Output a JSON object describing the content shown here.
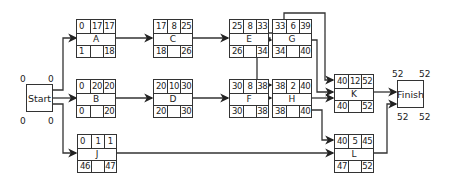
{
  "diagram": {
    "type": "activity-on-node network (PERT/CPM)",
    "start": {
      "label": "Start",
      "tl": "0",
      "tr": "0",
      "bl": "0",
      "br": "0"
    },
    "finish": {
      "label": "Finish",
      "tl": "52",
      "tr": "52",
      "bl": "52",
      "br": "52"
    },
    "nodes": {
      "A": {
        "name": "A",
        "es": "0",
        "dur": "17",
        "ef": "17",
        "ls": "1",
        "lf": "18"
      },
      "B": {
        "name": "B",
        "es": "0",
        "dur": "20",
        "ef": "20",
        "ls": "0",
        "lf": "20"
      },
      "C": {
        "name": "C",
        "es": "17",
        "dur": "8",
        "ef": "25",
        "ls": "18",
        "lf": "26"
      },
      "D": {
        "name": "D",
        "es": "20",
        "dur": "10",
        "ef": "30",
        "ls": "20",
        "lf": "30"
      },
      "E": {
        "name": "E",
        "es": "25",
        "dur": "8",
        "ef": "33",
        "ls": "26",
        "lf": "34"
      },
      "F": {
        "name": "F",
        "es": "30",
        "dur": "8",
        "ef": "38",
        "ls": "30",
        "lf": "38"
      },
      "G": {
        "name": "G",
        "es": "33",
        "dur": "6",
        "ef": "39",
        "ls": "34",
        "lf": "40"
      },
      "H": {
        "name": "H",
        "es": "38",
        "dur": "2",
        "ef": "40",
        "ls": "38",
        "lf": "40"
      },
      "J": {
        "name": "J",
        "es": "0",
        "dur": "1",
        "ef": "1",
        "ls": "46",
        "lf": "47"
      },
      "K": {
        "name": "K",
        "es": "40",
        "dur": "12",
        "ef": "52",
        "ls": "40",
        "lf": "52"
      },
      "L": {
        "name": "L",
        "es": "40",
        "dur": "5",
        "ef": "45",
        "ls": "47",
        "lf": "52"
      }
    },
    "edges": [
      [
        "Start",
        "A"
      ],
      [
        "Start",
        "B"
      ],
      [
        "Start",
        "J"
      ],
      [
        "A",
        "C"
      ],
      [
        "B",
        "D"
      ],
      [
        "C",
        "E"
      ],
      [
        "D",
        "F"
      ],
      [
        "E",
        "G"
      ],
      [
        "E",
        "H"
      ],
      [
        "E",
        "K"
      ],
      [
        "F",
        "H"
      ],
      [
        "G",
        "K"
      ],
      [
        "H",
        "K"
      ],
      [
        "H",
        "L"
      ],
      [
        "J",
        "L"
      ],
      [
        "K",
        "Finish"
      ],
      [
        "L",
        "Finish"
      ]
    ],
    "colors": {
      "line": "#333333",
      "background": "#ffffff"
    }
  }
}
